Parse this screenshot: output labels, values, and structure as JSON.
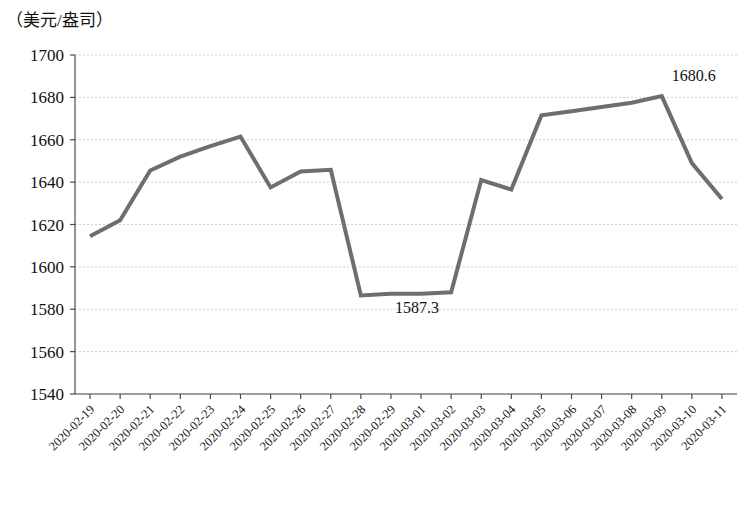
{
  "chart_data": {
    "type": "line",
    "title": "",
    "subtitle": "",
    "xlabel": "",
    "ylabel": "（美元/盎司）",
    "unit_label": "（美元/盎司）",
    "ylim": [
      1540,
      1700
    ],
    "ytick_labels": [
      "1700",
      "1680",
      "1660",
      "1640",
      "1620",
      "1600",
      "1580",
      "1560",
      "1540"
    ],
    "yticks": [
      1700,
      1680,
      1660,
      1640,
      1620,
      1600,
      1580,
      1560,
      1540
    ],
    "grid": true,
    "grid_axis": "y",
    "legend": null,
    "legend_position": "none",
    "line_color": "#6e6e6e",
    "line_width": 4,
    "categories": [
      "2020-02-19",
      "2020-02-20",
      "2020-02-21",
      "2020-02-22",
      "2020-02-23",
      "2020-02-24",
      "2020-02-25",
      "2020-02-26",
      "2020-02-27",
      "2020-02-28",
      "2020-02-29",
      "2020-03-01",
      "2020-03-02",
      "2020-03-03",
      "2020-03-04",
      "2020-03-05",
      "2020-03-06",
      "2020-03-07",
      "2020-03-08",
      "2020-03-09",
      "2020-03-10",
      "2020-03-11"
    ],
    "values": [
      1614.5,
      1622.0,
      1645.5,
      1652.0,
      1657.0,
      1661.5,
      1637.5,
      1645.0,
      1645.8,
      1586.5,
      1587.3,
      1587.3,
      1588.0,
      1641.0,
      1636.5,
      1671.5,
      1673.5,
      1675.5,
      1677.5,
      1680.6,
      1649.0,
      1632.0
    ],
    "annotations": [
      {
        "name": "minimum-label",
        "text": "1587.3",
        "category": "2020-02-29",
        "value": 1587.3
      },
      {
        "name": "maximum-label",
        "text": "1680.6",
        "category": "2020-03-09",
        "value": 1680.6
      }
    ]
  }
}
